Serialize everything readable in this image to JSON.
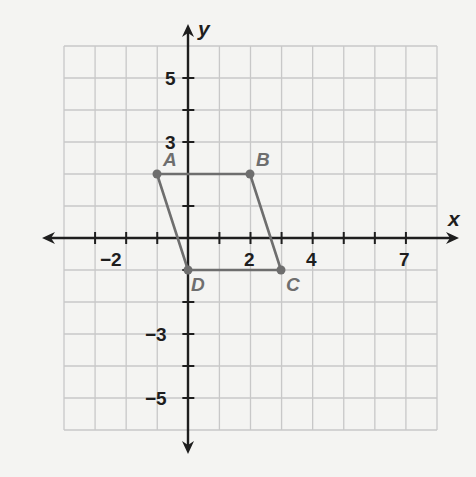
{
  "chart_data": {
    "type": "scatter",
    "title": "",
    "xlabel": "x",
    "ylabel": "y",
    "xlim": [
      -4,
      8
    ],
    "ylim": [
      -6,
      6
    ],
    "grid": true,
    "x_tick_labels": [
      {
        "value": -2,
        "label": "−2"
      },
      {
        "value": 2,
        "label": "2"
      },
      {
        "value": 4,
        "label": "4"
      },
      {
        "value": 7,
        "label": "7"
      }
    ],
    "y_tick_labels": [
      {
        "value": 5,
        "label": "5"
      },
      {
        "value": 3,
        "label": "3"
      },
      {
        "value": -3,
        "label": "−3"
      },
      {
        "value": -5,
        "label": "−5"
      }
    ],
    "series": [
      {
        "name": "Parallelogram ABCD",
        "closed": true,
        "points": [
          {
            "label": "A",
            "x": -1,
            "y": 2
          },
          {
            "label": "B",
            "x": 2,
            "y": 2
          },
          {
            "label": "C",
            "x": 3,
            "y": -1
          },
          {
            "label": "D",
            "x": 0,
            "y": -1
          }
        ]
      }
    ]
  },
  "colors": {
    "background": "#f4f4f2",
    "grid": "#c8c8c8",
    "axis": "#1e1e1e",
    "shape": "#6e6e6e"
  },
  "labels": {
    "x_axis": "x",
    "y_axis": "y",
    "vertex_A": "A",
    "vertex_B": "B",
    "vertex_C": "C",
    "vertex_D": "D",
    "tick_x_neg2": "−2",
    "tick_x_2": "2",
    "tick_x_4": "4",
    "tick_x_7": "7",
    "tick_y_5": "5",
    "tick_y_3": "3",
    "tick_y_neg3": "−3",
    "tick_y_neg5": "−5"
  }
}
